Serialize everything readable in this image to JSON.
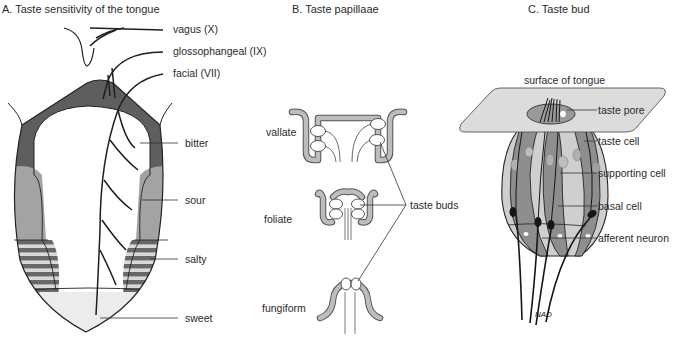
{
  "panels": {
    "a": {
      "title": "A. Taste sensitivity of the tongue",
      "nerves": {
        "vagus": "vagus (X)",
        "glossopharyngeal": "glossophangeal (IX)",
        "facial": "facial (VII)"
      },
      "regions": {
        "bitter": "bitter",
        "sour": "sour",
        "salty": "salty",
        "sweet": "sweet"
      }
    },
    "b": {
      "title": "B. Taste papillaae",
      "types": {
        "vallate": "vallate",
        "foliate": "foliate",
        "fungiform": "fungiform"
      },
      "pointer_label": "taste buds"
    },
    "c": {
      "title": "C. Taste bud",
      "labels": {
        "surface": "surface of tongue",
        "pore": "taste pore",
        "taste_cell": "taste cell",
        "supporting_cell": "supporting cell",
        "basal_cell": "basal cell",
        "afferent": "afferent neuron"
      },
      "signature": "NAD"
    }
  },
  "colors": {
    "bitter": "#5e5e5e",
    "sour": "#a3a3a3",
    "salty_dark": "#6a6a6a",
    "salty_light": "#d8d8d8",
    "sweet": "#ececec",
    "papilla": "#bdbdbd",
    "surface": "#dcdcdc",
    "bud_dark": "#8e8e8e",
    "bud_light": "#cfcfcf",
    "line": "#1e1e1e"
  }
}
